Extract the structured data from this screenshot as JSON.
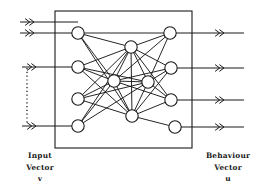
{
  "figure": {
    "type": "neural-network-schematic",
    "background_color": "#ffffff",
    "stroke_color": "#1a1a1a",
    "node_fill": "#ffffff"
  },
  "labels": {
    "input": {
      "line1": "Input",
      "line2": "Vector",
      "line3": "v"
    },
    "output": {
      "line1": "Behaviour",
      "line2": "Vector",
      "line3": "u"
    }
  },
  "network": {
    "box": {
      "x": 55,
      "y": 11,
      "width": 137,
      "height": 137
    },
    "node_radius": 6.2,
    "input_nodes": [
      {
        "id": "L1",
        "cx": 78,
        "cy": 33
      },
      {
        "id": "L2",
        "cx": 78,
        "cy": 67
      },
      {
        "id": "L3",
        "cx": 78,
        "cy": 99
      },
      {
        "id": "L4",
        "cx": 78,
        "cy": 126
      }
    ],
    "hidden_nodes": [
      {
        "id": "M1",
        "cx": 131,
        "cy": 47
      },
      {
        "id": "M2",
        "cx": 114,
        "cy": 81
      },
      {
        "id": "M3",
        "cx": 148,
        "cy": 82
      },
      {
        "id": "M4",
        "cx": 132,
        "cy": 116
      }
    ],
    "output_nodes": [
      {
        "id": "R1",
        "cx": 170,
        "cy": 33
      },
      {
        "id": "R2",
        "cx": 171,
        "cy": 68
      },
      {
        "id": "R3",
        "cx": 171,
        "cy": 100
      },
      {
        "id": "R4",
        "cx": 175,
        "cy": 127
      }
    ],
    "edges": [
      [
        "L1",
        "M1"
      ],
      [
        "L1",
        "M2"
      ],
      [
        "L1",
        "M4"
      ],
      [
        "L1",
        "R1"
      ],
      [
        "L2",
        "M1"
      ],
      [
        "L2",
        "M2"
      ],
      [
        "L2",
        "M3"
      ],
      [
        "L2",
        "M4"
      ],
      [
        "L3",
        "M1"
      ],
      [
        "L3",
        "M2"
      ],
      [
        "L3",
        "M3"
      ],
      [
        "L3",
        "M4"
      ],
      [
        "L4",
        "M1"
      ],
      [
        "L4",
        "M2"
      ],
      [
        "L4",
        "M3"
      ],
      [
        "M1",
        "M2"
      ],
      [
        "M1",
        "M3"
      ],
      [
        "M1",
        "M4"
      ],
      [
        "M2",
        "M3"
      ],
      [
        "M2",
        "M4"
      ],
      [
        "M3",
        "M4"
      ],
      [
        "M1",
        "R1"
      ],
      [
        "M1",
        "R2"
      ],
      [
        "M1",
        "R3"
      ],
      [
        "M2",
        "R1"
      ],
      [
        "M2",
        "R2"
      ],
      [
        "M2",
        "R3"
      ],
      [
        "M3",
        "R1"
      ],
      [
        "M3",
        "R2"
      ],
      [
        "M3",
        "R3"
      ],
      [
        "M4",
        "R2"
      ],
      [
        "M4",
        "R3"
      ],
      [
        "M4",
        "R4"
      ]
    ],
    "input_arrows": [
      {
        "id": "in1",
        "y": 22,
        "x_start": 20,
        "x_end": 78
      },
      {
        "id": "in2",
        "y": 33,
        "x_start": 20,
        "x_end": 78
      },
      {
        "id": "in3",
        "y": 67,
        "x_start": 22,
        "x_end": 78
      },
      {
        "id": "in4",
        "y": 126,
        "x_start": 22,
        "x_end": 78
      }
    ],
    "output_arrows": [
      {
        "id": "out1",
        "y": 33,
        "x_start": 170,
        "x_end": 244
      },
      {
        "id": "out2",
        "y": 68,
        "x_start": 171,
        "x_end": 244
      },
      {
        "id": "out3",
        "y": 100,
        "x_start": 171,
        "x_end": 244
      },
      {
        "id": "out4",
        "y": 127,
        "x_start": 175,
        "x_end": 244
      }
    ],
    "dotted_connector": {
      "x": 27,
      "y_start": 68,
      "y_end": 125
    }
  }
}
